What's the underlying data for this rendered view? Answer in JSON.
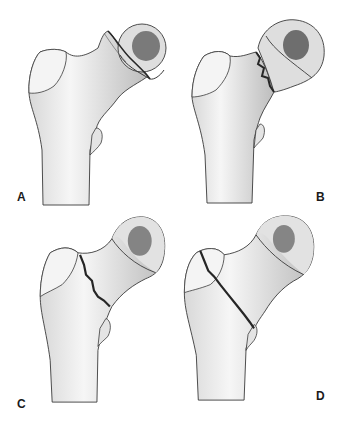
{
  "figure": {
    "panels": [
      {
        "label": "A",
        "description": "displaced subcapital femoral neck fracture"
      },
      {
        "label": "B",
        "description": "transcervical femoral neck fracture"
      },
      {
        "label": "C",
        "description": "basicervical femoral neck fracture"
      },
      {
        "label": "D",
        "description": "intertrochanteric fracture"
      }
    ]
  },
  "colors": {
    "background": "#ffffff",
    "bone_light": "#efefef",
    "bone_shade": "#b8b8b8",
    "outline": "#3a3a3a",
    "fracture_line": "#262626",
    "label": "#1a1a1a"
  }
}
